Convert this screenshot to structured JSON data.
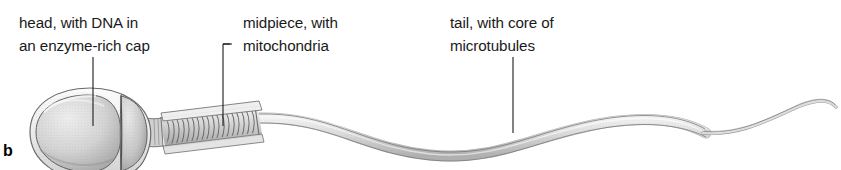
{
  "figure": {
    "panel_label": "b",
    "background_color": "#ffffff",
    "ink_color": "#1a1a1a",
    "cell_fill_light": "#e4e4e4",
    "cell_fill_mid": "#c9c9c9",
    "cell_fill_dark": "#9a9a9a",
    "outline_color": "#5a5a5a"
  },
  "callouts": [
    {
      "id": "head",
      "line1": "head, with DNA in",
      "line2": "an enzyme-rich cap",
      "leader": "vertical"
    },
    {
      "id": "midpiece",
      "line1": "midpiece, with",
      "line2": "mitochondria",
      "leader": "elbow"
    },
    {
      "id": "tail",
      "line1": "tail, with core of",
      "line2": "microtubules",
      "leader": "vertical"
    }
  ],
  "parts": [
    {
      "name": "head",
      "description": "oval head containing nucleus and acrosomal cap"
    },
    {
      "name": "neck",
      "description": "narrow junction between head and midpiece"
    },
    {
      "name": "midpiece",
      "description": "coiled mitochondrial helix"
    },
    {
      "name": "tail",
      "description": "long wavy flagellum with microtubule core"
    },
    {
      "name": "end-piece",
      "description": "thin tapering tail tip"
    }
  ]
}
